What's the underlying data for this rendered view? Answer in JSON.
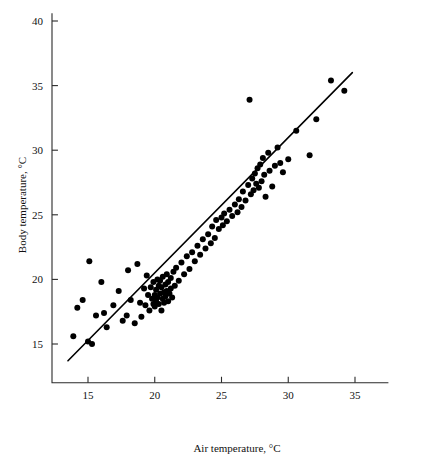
{
  "chart_data": {
    "type": "scatter",
    "title": "",
    "xlabel": "Air temperature, °C",
    "ylabel": "Body temperature, °C",
    "xlim": [
      12.3,
      37.5
    ],
    "ylim": [
      12.0,
      40.6
    ],
    "xticks": [
      15,
      20,
      25,
      30,
      35
    ],
    "yticks": [
      15,
      20,
      25,
      30,
      35,
      40
    ],
    "xticklabels": [
      "15",
      "20",
      "25",
      "30",
      "35"
    ],
    "yticklabels": [
      "15",
      "20",
      "25",
      "30",
      "35",
      "40"
    ],
    "grid": false,
    "legend": null,
    "marker": "filled-circle",
    "marker_color": "#000000",
    "point_count": 114,
    "trendline": {
      "label": "regression line",
      "color": "#000000",
      "x_start": 13.5,
      "y_start": 13.7,
      "x_end": 34.8,
      "y_end": 36.0
    },
    "points": [
      [
        13.9,
        15.6
      ],
      [
        14.2,
        17.8
      ],
      [
        14.6,
        18.4
      ],
      [
        15.0,
        15.2
      ],
      [
        15.1,
        21.4
      ],
      [
        15.3,
        15.0
      ],
      [
        15.6,
        17.2
      ],
      [
        16.0,
        19.8
      ],
      [
        16.2,
        17.4
      ],
      [
        16.4,
        16.3
      ],
      [
        16.9,
        18.0
      ],
      [
        17.3,
        19.1
      ],
      [
        17.6,
        16.8
      ],
      [
        17.9,
        17.2
      ],
      [
        18.0,
        20.7
      ],
      [
        18.2,
        18.4
      ],
      [
        18.5,
        16.6
      ],
      [
        18.7,
        21.2
      ],
      [
        18.9,
        18.2
      ],
      [
        19.0,
        17.1
      ],
      [
        19.2,
        19.3
      ],
      [
        19.3,
        18.0
      ],
      [
        19.4,
        20.3
      ],
      [
        19.5,
        18.8
      ],
      [
        19.6,
        17.6
      ],
      [
        19.7,
        19.4
      ],
      [
        19.8,
        18.5
      ],
      [
        19.9,
        18.1
      ],
      [
        19.9,
        19.8
      ],
      [
        20.0,
        18.8
      ],
      [
        20.0,
        17.9
      ],
      [
        20.1,
        19.2
      ],
      [
        20.1,
        18.3
      ],
      [
        20.2,
        20.0
      ],
      [
        20.2,
        18.6
      ],
      [
        20.3,
        19.5
      ],
      [
        20.3,
        18.1
      ],
      [
        20.4,
        19.9
      ],
      [
        20.4,
        18.9
      ],
      [
        20.5,
        17.6
      ],
      [
        20.5,
        19.4
      ],
      [
        20.6,
        18.5
      ],
      [
        20.6,
        20.2
      ],
      [
        20.7,
        19.0
      ],
      [
        20.7,
        18.2
      ],
      [
        20.8,
        19.6
      ],
      [
        20.8,
        18.7
      ],
      [
        20.9,
        20.4
      ],
      [
        20.9,
        19.1
      ],
      [
        21.0,
        18.3
      ],
      [
        21.0,
        19.8
      ],
      [
        21.1,
        18.9
      ],
      [
        21.2,
        20.1
      ],
      [
        21.2,
        19.3
      ],
      [
        21.3,
        18.6
      ],
      [
        21.4,
        20.6
      ],
      [
        21.5,
        19.5
      ],
      [
        21.6,
        20.9
      ],
      [
        21.8,
        19.9
      ],
      [
        22.0,
        21.3
      ],
      [
        22.2,
        20.4
      ],
      [
        22.4,
        21.8
      ],
      [
        22.6,
        20.8
      ],
      [
        22.8,
        22.1
      ],
      [
        23.0,
        21.4
      ],
      [
        23.2,
        22.6
      ],
      [
        23.4,
        21.9
      ],
      [
        23.6,
        23.1
      ],
      [
        23.8,
        22.4
      ],
      [
        24.0,
        23.5
      ],
      [
        24.2,
        22.8
      ],
      [
        24.3,
        24.1
      ],
      [
        24.5,
        23.2
      ],
      [
        24.6,
        24.6
      ],
      [
        24.8,
        23.9
      ],
      [
        25.0,
        24.8
      ],
      [
        25.1,
        24.2
      ],
      [
        25.2,
        25.1
      ],
      [
        25.4,
        24.5
      ],
      [
        25.6,
        25.4
      ],
      [
        25.8,
        24.9
      ],
      [
        26.0,
        25.8
      ],
      [
        26.2,
        25.2
      ],
      [
        26.3,
        26.2
      ],
      [
        26.5,
        25.6
      ],
      [
        26.6,
        26.8
      ],
      [
        26.8,
        26.1
      ],
      [
        27.0,
        27.3
      ],
      [
        27.1,
        33.9
      ],
      [
        27.2,
        26.6
      ],
      [
        27.3,
        27.8
      ],
      [
        27.4,
        26.9
      ],
      [
        27.5,
        28.2
      ],
      [
        27.6,
        27.4
      ],
      [
        27.7,
        28.6
      ],
      [
        27.8,
        27.1
      ],
      [
        27.9,
        28.9
      ],
      [
        28.0,
        27.6
      ],
      [
        28.1,
        29.4
      ],
      [
        28.2,
        28.1
      ],
      [
        28.3,
        26.4
      ],
      [
        28.5,
        29.8
      ],
      [
        28.6,
        28.4
      ],
      [
        28.8,
        27.2
      ],
      [
        29.0,
        28.8
      ],
      [
        29.2,
        30.2
      ],
      [
        29.4,
        29.0
      ],
      [
        29.6,
        28.3
      ],
      [
        30.0,
        29.3
      ],
      [
        30.6,
        31.5
      ],
      [
        31.6,
        29.6
      ],
      [
        32.1,
        32.4
      ],
      [
        33.2,
        35.4
      ],
      [
        34.2,
        34.6
      ]
    ]
  }
}
